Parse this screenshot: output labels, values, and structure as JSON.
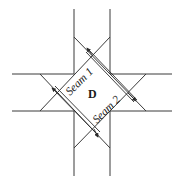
{
  "diagram": {
    "title": "",
    "region_label": "D",
    "seams": [
      {
        "label": "Seam 1"
      },
      {
        "label": "Seam 2"
      }
    ],
    "colors": {
      "line": "#3a3a3a",
      "text": "#1a1a1a",
      "background": "#ffffff"
    }
  }
}
